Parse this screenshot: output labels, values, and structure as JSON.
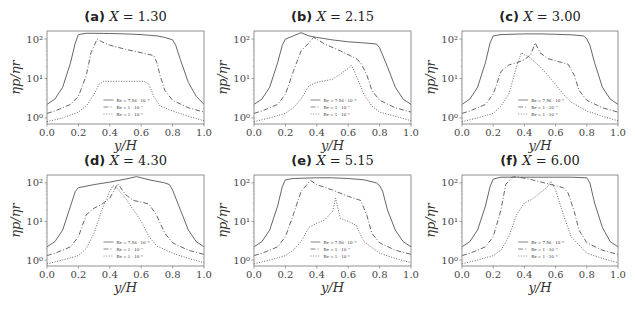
{
  "figure": {
    "ylabel": "ηp/ηr",
    "xlabel": "y/H",
    "xticks": [
      "0.0",
      "0.2",
      "0.4",
      "0.6",
      "0.8",
      "1.0"
    ],
    "yticks": [
      "10⁰",
      "10¹",
      "10²"
    ],
    "legend": [
      "Re = 7.56 · 10⁻⁸",
      "Re = 1 · 10⁻⁷",
      "Re = 1 · 10⁻⁵"
    ]
  },
  "chart_data": [
    {
      "type": "line",
      "panel": "(a)",
      "title": "(a) X = 1.30",
      "xlabel": "y/H",
      "ylabel": "ηp/ηr",
      "yscale": "log",
      "xlim": [
        0,
        1
      ],
      "ylim": [
        0.7,
        160
      ],
      "series": [
        {
          "name": "Re = 7.56 · 10⁻⁸",
          "style": "solid",
          "x": [
            0,
            0.05,
            0.1,
            0.15,
            0.18,
            0.2,
            0.25,
            0.3,
            0.4,
            0.5,
            0.6,
            0.7,
            0.75,
            0.8,
            0.82,
            0.85,
            0.9,
            0.95,
            1.0
          ],
          "y": [
            2.2,
            3,
            6,
            25,
            80,
            130,
            140,
            140,
            138,
            135,
            130,
            120,
            110,
            95,
            70,
            30,
            8,
            3.5,
            2.2
          ]
        },
        {
          "name": "Re = 1 · 10⁻⁷",
          "style": "dashdot",
          "x": [
            0,
            0.05,
            0.1,
            0.15,
            0.2,
            0.25,
            0.28,
            0.32,
            0.35,
            0.4,
            0.5,
            0.6,
            0.68,
            0.7,
            0.72,
            0.75,
            0.8,
            0.9,
            1.0
          ],
          "y": [
            1.3,
            1.5,
            1.8,
            2.2,
            3.5,
            12,
            45,
            100,
            85,
            70,
            55,
            45,
            38,
            25,
            12,
            5,
            2.8,
            1.8,
            1.4
          ]
        },
        {
          "name": "Re = 1 · 10⁻⁵",
          "style": "dotted",
          "x": [
            0,
            0.1,
            0.2,
            0.25,
            0.3,
            0.33,
            0.36,
            0.45,
            0.55,
            0.62,
            0.65,
            0.68,
            0.72,
            0.8,
            0.9,
            1.0
          ],
          "y": [
            0.8,
            1.0,
            1.4,
            2,
            4,
            7,
            8.5,
            8.5,
            8.5,
            8.5,
            7,
            3.5,
            2,
            1.5,
            1.1,
            0.85
          ]
        }
      ]
    },
    {
      "type": "line",
      "panel": "(b)",
      "title": "(b) X = 2.15",
      "xlabel": "y/H",
      "ylabel": "ηp/ηr",
      "yscale": "log",
      "xlim": [
        0,
        1
      ],
      "ylim": [
        0.7,
        160
      ],
      "series": [
        {
          "name": "Re = 7.56 · 10⁻⁸",
          "style": "solid",
          "x": [
            0,
            0.05,
            0.1,
            0.15,
            0.18,
            0.2,
            0.25,
            0.3,
            0.35,
            0.4,
            0.5,
            0.6,
            0.7,
            0.78,
            0.8,
            0.85,
            0.9,
            0.95,
            1.0
          ],
          "y": [
            2.2,
            3,
            6,
            25,
            70,
            100,
            120,
            145,
            120,
            110,
            95,
            85,
            80,
            75,
            60,
            20,
            6,
            3,
            2.2
          ]
        },
        {
          "name": "Re = 1 · 10⁻⁷",
          "style": "dashdot",
          "x": [
            0,
            0.05,
            0.1,
            0.15,
            0.2,
            0.25,
            0.3,
            0.35,
            0.38,
            0.45,
            0.55,
            0.65,
            0.68,
            0.72,
            0.75,
            0.8,
            0.9,
            1.0
          ],
          "y": [
            1.3,
            1.5,
            1.8,
            2.2,
            4,
            15,
            50,
            80,
            110,
            75,
            50,
            32,
            25,
            12,
            5,
            2.8,
            1.8,
            1.4
          ]
        },
        {
          "name": "Re = 1 · 10⁻⁵",
          "style": "dotted",
          "x": [
            0,
            0.1,
            0.2,
            0.25,
            0.3,
            0.35,
            0.4,
            0.5,
            0.55,
            0.6,
            0.62,
            0.65,
            0.7,
            0.75,
            0.8,
            0.9,
            1.0
          ],
          "y": [
            0.8,
            1.0,
            1.3,
            1.8,
            3,
            6.5,
            8,
            9.5,
            13,
            18,
            22,
            12,
            4,
            2,
            1.4,
            1.1,
            0.85
          ]
        }
      ]
    },
    {
      "type": "line",
      "panel": "(c)",
      "title": "(c) X = 3.00",
      "xlabel": "y/H",
      "ylabel": "ηp/ηr",
      "yscale": "log",
      "xlim": [
        0,
        1
      ],
      "ylim": [
        0.7,
        160
      ],
      "series": [
        {
          "name": "Re = 7.56 · 10⁻⁸",
          "style": "solid",
          "x": [
            0,
            0.05,
            0.1,
            0.15,
            0.18,
            0.2,
            0.25,
            0.4,
            0.5,
            0.6,
            0.7,
            0.78,
            0.8,
            0.82,
            0.85,
            0.9,
            0.95,
            1.0
          ],
          "y": [
            2.2,
            3,
            6,
            25,
            80,
            120,
            130,
            135,
            135,
            132,
            128,
            120,
            100,
            70,
            25,
            6,
            3,
            2.2
          ]
        },
        {
          "name": "Re = 1 · 10⁻⁷",
          "style": "dashdot",
          "x": [
            0,
            0.05,
            0.1,
            0.15,
            0.2,
            0.25,
            0.3,
            0.35,
            0.4,
            0.44,
            0.47,
            0.5,
            0.55,
            0.6,
            0.68,
            0.72,
            0.75,
            0.8,
            0.9,
            1.0
          ],
          "y": [
            1.3,
            1.5,
            1.8,
            2.2,
            4,
            15,
            22,
            25,
            30,
            40,
            80,
            45,
            32,
            28,
            23,
            12,
            5,
            2.8,
            1.8,
            1.4
          ]
        },
        {
          "name": "Re = 1 · 10⁻⁵",
          "style": "dotted",
          "x": [
            0,
            0.1,
            0.2,
            0.25,
            0.3,
            0.35,
            0.38,
            0.4,
            0.43,
            0.5,
            0.55,
            0.6,
            0.65,
            0.7,
            0.8,
            0.9,
            1.0
          ],
          "y": [
            0.8,
            1.0,
            1.3,
            2,
            4,
            20,
            45,
            40,
            35,
            20,
            12,
            7,
            4,
            2.5,
            1.5,
            1.1,
            0.85
          ]
        }
      ]
    },
    {
      "type": "line",
      "panel": "(d)",
      "title": "(d) X = 4.30",
      "xlabel": "y/H",
      "ylabel": "ηp/ηr",
      "yscale": "log",
      "xlim": [
        0,
        1
      ],
      "ylim": [
        0.7,
        160
      ],
      "series": [
        {
          "name": "Re = 7.56 · 10⁻⁸",
          "style": "solid",
          "x": [
            0,
            0.05,
            0.1,
            0.15,
            0.18,
            0.2,
            0.3,
            0.4,
            0.5,
            0.57,
            0.65,
            0.75,
            0.78,
            0.8,
            0.85,
            0.9,
            0.95,
            1.0
          ],
          "y": [
            2.2,
            3,
            6,
            25,
            60,
            75,
            90,
            105,
            125,
            145,
            120,
            100,
            90,
            65,
            20,
            6,
            3,
            2.2
          ]
        },
        {
          "name": "Re = 1 · 10⁻⁷",
          "style": "dashdot",
          "x": [
            0,
            0.05,
            0.1,
            0.15,
            0.2,
            0.25,
            0.3,
            0.35,
            0.4,
            0.45,
            0.5,
            0.55,
            0.6,
            0.65,
            0.7,
            0.75,
            0.8,
            0.9,
            1.0
          ],
          "y": [
            1.3,
            1.5,
            1.8,
            2.2,
            4,
            15,
            22,
            28,
            40,
            95,
            50,
            35,
            32,
            28,
            14,
            5,
            2.8,
            1.8,
            1.4
          ]
        },
        {
          "name": "Re = 1 · 10⁻⁵",
          "style": "dotted",
          "x": [
            0,
            0.1,
            0.2,
            0.25,
            0.3,
            0.35,
            0.4,
            0.42,
            0.45,
            0.5,
            0.55,
            0.6,
            0.65,
            0.7,
            0.8,
            0.9,
            1.0
          ],
          "y": [
            0.8,
            1.0,
            1.3,
            2,
            5,
            20,
            60,
            85,
            70,
            40,
            20,
            10,
            4,
            2.3,
            1.5,
            1.1,
            0.85
          ]
        }
      ]
    },
    {
      "type": "line",
      "panel": "(e)",
      "title": "(e) X = 5.15",
      "xlabel": "y/H",
      "ylabel": "ηp/ηr",
      "yscale": "log",
      "xlim": [
        0,
        1
      ],
      "ylim": [
        0.7,
        160
      ],
      "series": [
        {
          "name": "Re = 7.56 · 10⁻⁸",
          "style": "solid",
          "x": [
            0,
            0.05,
            0.1,
            0.15,
            0.18,
            0.2,
            0.25,
            0.4,
            0.5,
            0.6,
            0.7,
            0.78,
            0.8,
            0.82,
            0.85,
            0.9,
            0.95,
            1.0
          ],
          "y": [
            2.2,
            3,
            6,
            25,
            80,
            120,
            130,
            135,
            135,
            130,
            120,
            100,
            85,
            60,
            20,
            6,
            3,
            2.2
          ]
        },
        {
          "name": "Re = 1 · 10⁻⁷",
          "style": "dashdot",
          "x": [
            0,
            0.05,
            0.1,
            0.15,
            0.2,
            0.25,
            0.3,
            0.36,
            0.4,
            0.5,
            0.6,
            0.68,
            0.72,
            0.75,
            0.8,
            0.9,
            1.0
          ],
          "y": [
            1.3,
            1.5,
            1.8,
            2.2,
            4,
            15,
            60,
            115,
            90,
            65,
            45,
            35,
            14,
            5,
            2.8,
            1.8,
            1.4
          ]
        },
        {
          "name": "Re = 1 · 10⁻⁵",
          "style": "dotted",
          "x": [
            0,
            0.1,
            0.2,
            0.25,
            0.3,
            0.35,
            0.4,
            0.45,
            0.5,
            0.52,
            0.55,
            0.6,
            0.65,
            0.7,
            0.8,
            0.9,
            1.0
          ],
          "y": [
            0.8,
            1.0,
            1.3,
            1.8,
            3,
            7,
            9,
            11,
            18,
            40,
            12,
            10,
            8,
            3,
            1.5,
            1.1,
            0.85
          ]
        }
      ]
    },
    {
      "type": "line",
      "panel": "(f)",
      "title": "(f) X = 6.00",
      "xlabel": "y/H",
      "ylabel": "ηp/ηr",
      "yscale": "log",
      "xlim": [
        0,
        1
      ],
      "ylim": [
        0.7,
        160
      ],
      "series": [
        {
          "name": "Re = 7.56 · 10⁻⁸",
          "style": "solid",
          "x": [
            0,
            0.05,
            0.1,
            0.15,
            0.18,
            0.2,
            0.25,
            0.4,
            0.5,
            0.6,
            0.7,
            0.8,
            0.82,
            0.85,
            0.9,
            0.95,
            1.0
          ],
          "y": [
            2.2,
            3,
            6,
            25,
            80,
            125,
            140,
            140,
            140,
            140,
            140,
            135,
            100,
            30,
            7,
            3,
            2.2
          ]
        },
        {
          "name": "Re = 1 · 10⁻⁷",
          "style": "dashdot",
          "x": [
            0,
            0.05,
            0.1,
            0.15,
            0.2,
            0.25,
            0.28,
            0.32,
            0.35,
            0.45,
            0.55,
            0.65,
            0.68,
            0.72,
            0.75,
            0.8,
            0.9,
            1.0
          ],
          "y": [
            1.3,
            1.5,
            1.8,
            2.2,
            4,
            20,
            90,
            140,
            145,
            120,
            95,
            75,
            55,
            18,
            6,
            2.8,
            1.8,
            1.4
          ]
        },
        {
          "name": "Re = 1 · 10⁻⁵",
          "style": "dotted",
          "x": [
            0,
            0.1,
            0.2,
            0.25,
            0.3,
            0.35,
            0.4,
            0.45,
            0.5,
            0.55,
            0.57,
            0.6,
            0.65,
            0.7,
            0.8,
            0.9,
            1.0
          ],
          "y": [
            0.8,
            1.0,
            1.3,
            1.8,
            4,
            15,
            30,
            38,
            55,
            80,
            110,
            65,
            15,
            4,
            1.5,
            1.1,
            0.85
          ]
        }
      ]
    }
  ]
}
